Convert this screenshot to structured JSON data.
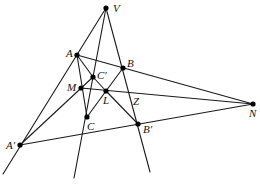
{
  "diagram": {
    "type": "projective-geometry",
    "points": [
      {
        "id": "V",
        "label": "V",
        "x": 106,
        "y": 8,
        "lx": 113,
        "ly": 12
      },
      {
        "id": "A",
        "label": "A",
        "x": 77,
        "y": 55,
        "lx": 66,
        "ly": 57
      },
      {
        "id": "B",
        "label": "B",
        "x": 123,
        "y": 68,
        "lx": 127,
        "ly": 67
      },
      {
        "id": "Cp",
        "label": "C′",
        "x": 93,
        "y": 77,
        "lx": 97,
        "ly": 79
      },
      {
        "id": "M",
        "label": "M",
        "x": 81,
        "y": 88,
        "lx": 67,
        "ly": 91
      },
      {
        "id": "L",
        "label": "L",
        "x": 106,
        "y": 91,
        "lx": 103,
        "ly": 104
      },
      {
        "id": "C",
        "label": "C",
        "x": 87,
        "y": 117,
        "lx": 87,
        "ly": 130
      },
      {
        "id": "Bp",
        "label": "B′",
        "x": 138,
        "y": 124,
        "lx": 143,
        "ly": 133
      },
      {
        "id": "N",
        "label": "N",
        "x": 253,
        "y": 104,
        "lx": 249,
        "ly": 117
      },
      {
        "id": "Ap",
        "label": "A′",
        "x": 20,
        "y": 145,
        "lx": 6,
        "ly": 149
      }
    ],
    "unmarked_labels": [
      {
        "label": "Z",
        "x": 133,
        "y": 105
      }
    ],
    "lines": [
      {
        "name": "line-VA-Aprime",
        "x1": 106,
        "y1": 8,
        "x2": 3,
        "y2": 174
      },
      {
        "name": "line-VCprime-C",
        "x1": 106,
        "y1": 8,
        "x2": 74,
        "y2": 178
      },
      {
        "name": "line-VB-Bprime",
        "x1": 106,
        "y1": 8,
        "x2": 150,
        "y2": 172
      },
      {
        "name": "line-ABN",
        "x1": 77,
        "y1": 55,
        "x2": 253,
        "y2": 104
      },
      {
        "name": "line-Aprime-BprimeN",
        "x1": 20,
        "y1": 145,
        "x2": 253,
        "y2": 104
      },
      {
        "name": "line-MLN",
        "x1": 81,
        "y1": 88,
        "x2": 253,
        "y2": 104
      },
      {
        "name": "line-Aprime-M-Cprime",
        "x1": 20,
        "y1": 145,
        "x2": 93,
        "y2": 77
      },
      {
        "name": "line-AMC",
        "x1": 77,
        "y1": 55,
        "x2": 87,
        "y2": 117
      },
      {
        "name": "line-Cprime-L",
        "x1": 93,
        "y1": 77,
        "x2": 106,
        "y2": 91
      },
      {
        "name": "line-LB",
        "x1": 106,
        "y1": 91,
        "x2": 123,
        "y2": 68
      },
      {
        "name": "line-CL",
        "x1": 87,
        "y1": 117,
        "x2": 106,
        "y2": 91
      },
      {
        "name": "line-L-Bprime",
        "x1": 106,
        "y1": 91,
        "x2": 138,
        "y2": 124
      },
      {
        "name": "line-A-Cprime",
        "x1": 77,
        "y1": 55,
        "x2": 93,
        "y2": 77
      }
    ]
  }
}
